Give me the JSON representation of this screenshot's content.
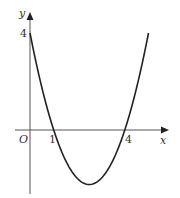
{
  "chart_data": {
    "type": "line",
    "title": "",
    "function": "y = (x - 1)(x - 4) = x^2 - 5x + 4",
    "xlabel": "x",
    "ylabel": "y",
    "origin_label": "O",
    "x_tick_labels": [
      "1",
      "4"
    ],
    "y_tick_labels": [
      "4"
    ],
    "key_points": [
      {
        "x": 0,
        "y": 4,
        "label": "y-intercept"
      },
      {
        "x": 1,
        "y": 0,
        "label": "root"
      },
      {
        "x": 4,
        "y": 0,
        "label": "root"
      },
      {
        "x": 2.5,
        "y": -2.25,
        "label": "minimum"
      }
    ],
    "x": [
      0,
      0.5,
      1,
      1.5,
      2,
      2.5,
      3,
      3.5,
      4,
      4.5,
      5
    ],
    "series": [
      {
        "name": "curve",
        "values": [
          4,
          1.75,
          0,
          -1.25,
          -2,
          -2.25,
          -2,
          -1.25,
          0,
          1.75,
          4
        ]
      }
    ],
    "xlim": [
      -0.6,
      5.8
    ],
    "ylim": [
      -2.6,
      4.8
    ],
    "grid": false,
    "legend": "none",
    "colors": {
      "curve": "#222222",
      "axes": "#555555"
    }
  },
  "labels": {
    "x_axis": "x",
    "y_axis": "y",
    "origin": "O",
    "tick_x_1": "1",
    "tick_x_4": "4",
    "tick_y_4": "4"
  }
}
